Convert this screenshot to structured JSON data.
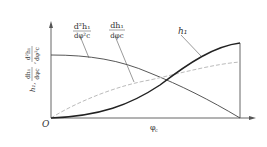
{
  "diagram": {
    "origin_label": "O",
    "x_axis_label": "φ_c",
    "x_axis_label_main": "φ",
    "x_axis_label_sub": "c",
    "y_axis_label": "h1, dh1/dφc, d²h1/dφc²",
    "curves": [
      {
        "id": "second-derivative",
        "label_num": "d²h₁",
        "label_den": "dφ²c",
        "style": "solid-thin",
        "color": "#444444"
      },
      {
        "id": "first-derivative",
        "label_num": "dh₁",
        "label_den": "dφc",
        "style": "dashed",
        "color": "#bbbbbb"
      },
      {
        "id": "h1",
        "label": "h₁",
        "style": "solid-thick",
        "color": "#222222"
      }
    ],
    "y_label_parts": {
      "h": "h₁,",
      "d1_num": "dh₁",
      "d1_den": "dφc",
      "d2_num": "d²h₁",
      "d2_den": "dφ²c"
    }
  }
}
